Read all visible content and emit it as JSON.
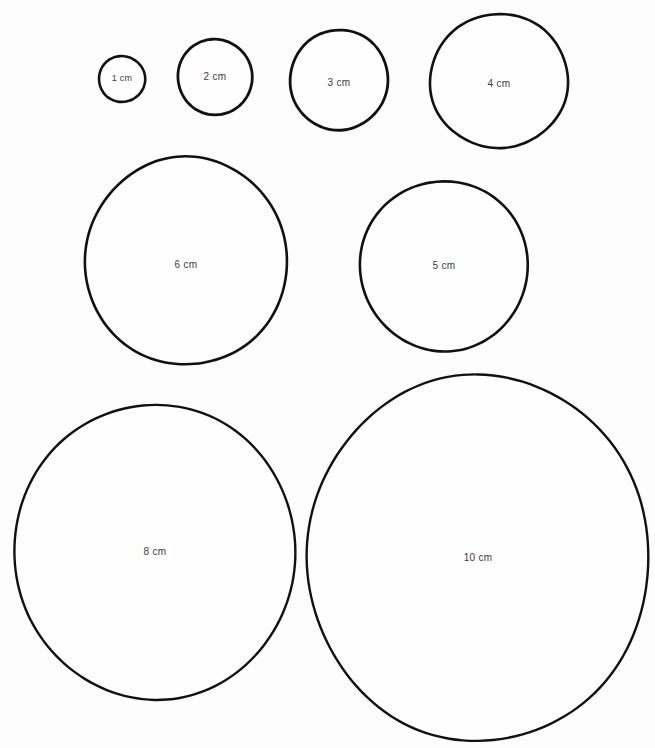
{
  "page": {
    "background_color": "#fdfdfd",
    "stroke_color": "#111111",
    "label_color": "#3c3c3c",
    "width": 655,
    "height": 748
  },
  "units": "cm",
  "circles": [
    {
      "id": "circle-1cm",
      "label": "1 cm",
      "size_cm": 1,
      "cx": 122,
      "cy": 79,
      "rx": 23,
      "ry": 23,
      "stroke_width": 2.6,
      "font_size": 9,
      "label_dy": 0,
      "row": 1
    },
    {
      "id": "circle-2cm",
      "label": "2 cm",
      "size_cm": 2,
      "cx": 215,
      "cy": 77,
      "rx": 37,
      "ry": 38,
      "stroke_width": 2.8,
      "font_size": 10,
      "label_dy": 0,
      "row": 1
    },
    {
      "id": "circle-3cm",
      "label": "3 cm",
      "size_cm": 3,
      "cx": 339,
      "cy": 80,
      "rx": 49,
      "ry": 50,
      "stroke_width": 2.8,
      "font_size": 10,
      "label_dy": 3,
      "row": 1
    },
    {
      "id": "circle-4cm",
      "label": "4 cm",
      "size_cm": 4,
      "cx": 499,
      "cy": 81,
      "rx": 69,
      "ry": 67,
      "stroke_width": 2.6,
      "font_size": 10,
      "label_dy": 3,
      "row": 1
    },
    {
      "id": "circle-6cm",
      "label": "6 cm",
      "size_cm": 6,
      "cx": 186,
      "cy": 261,
      "rx": 101,
      "ry": 104,
      "stroke_width": 2.6,
      "font_size": 10,
      "label_dy": 4,
      "row": 2
    },
    {
      "id": "circle-5cm",
      "label": "5 cm",
      "size_cm": 5,
      "cx": 444,
      "cy": 266,
      "rx": 84,
      "ry": 85,
      "stroke_width": 2.6,
      "font_size": 10,
      "label_dy": 0,
      "row": 2
    },
    {
      "id": "circle-8cm",
      "label": "8 cm",
      "size_cm": 8,
      "cx": 155,
      "cy": 552,
      "rx": 141,
      "ry": 147,
      "stroke_width": 2.4,
      "font_size": 10,
      "label_dy": 0,
      "row": 3
    },
    {
      "id": "circle-10cm",
      "label": "10 cm",
      "size_cm": 10,
      "cx": 478,
      "cy": 558,
      "rx": 172,
      "ry": 182,
      "stroke_width": 2.4,
      "font_size": 10,
      "label_dy": 0,
      "row": 3
    }
  ]
}
